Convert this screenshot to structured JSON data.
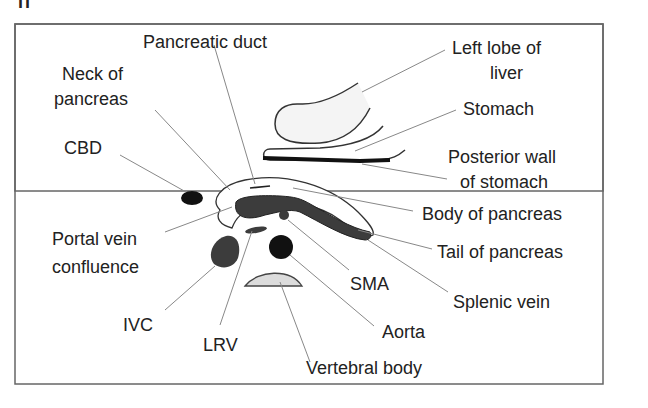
{
  "figure": {
    "panel_mark": "ii",
    "labels": {
      "pancreatic_duct": "Pancreatic duct",
      "neck_of_pancreas_1": "Neck of",
      "neck_of_pancreas_2": "pancreas",
      "cbd": "CBD",
      "portal_vein_confluence_1": "Portal vein",
      "portal_vein_confluence_2": "confluence",
      "ivc": "IVC",
      "lrv": "LRV",
      "vertebral_body": "Vertebral body",
      "aorta": "Aorta",
      "sma": "SMA",
      "splenic_vein": "Splenic vein",
      "tail_of_pancreas": "Tail of pancreas",
      "body_of_pancreas": "Body of pancreas",
      "posterior_wall_1": "Posterior wall",
      "posterior_wall_2": "of stomach",
      "stomach": "Stomach",
      "left_lobe_1": "Left lobe of",
      "left_lobe_2": "liver"
    },
    "colors": {
      "stroke": "#333333",
      "leader": "#777777",
      "dark_fill": "#3a3a3a",
      "black_fill": "#111111",
      "light_fill": "#f2f2f2",
      "bone_fill": "#d9d9d9"
    }
  }
}
